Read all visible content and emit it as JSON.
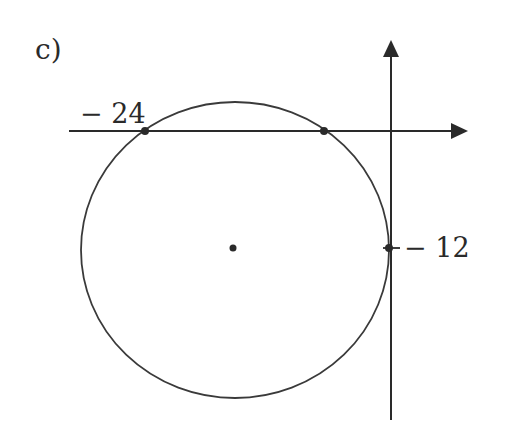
{
  "figure": {
    "part_label": "c)",
    "x_axis_label": "− 24",
    "y_axis_label": "− 12",
    "colors": {
      "ink": "#2a2a2a",
      "background": "#ffffff"
    },
    "shapes": {
      "circle": {
        "description": "circle tangent to y-axis",
        "center_px": [
          234,
          248
        ],
        "rx_px": 154,
        "ry_px": 148
      },
      "points": [
        {
          "name": "x-intercept-left",
          "value": "-24"
        },
        {
          "name": "x-intercept-right",
          "value": ""
        },
        {
          "name": "tangent-point-y-axis",
          "value": "-12"
        },
        {
          "name": "center",
          "value": ""
        }
      ]
    }
  }
}
